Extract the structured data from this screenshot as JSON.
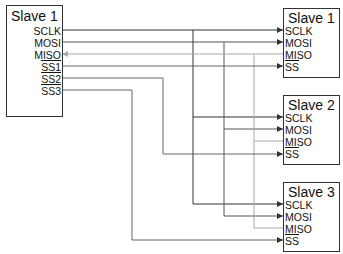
{
  "master": {
    "title": "Slave 1",
    "pins": [
      "SCLK",
      "MOSI",
      "MISO",
      "SS1",
      "SS2",
      "SS3"
    ]
  },
  "slaves": [
    {
      "title": "Slave 1",
      "pins": [
        "SCLK",
        "MOSI",
        "MISO",
        "SS"
      ]
    },
    {
      "title": "Slave 2",
      "pins": [
        "SCLK",
        "MOSI",
        "MISO",
        "SS"
      ]
    },
    {
      "title": "Slave 3",
      "pins": [
        "SCLK",
        "MOSI",
        "MISO",
        "SS"
      ]
    }
  ],
  "colors": {
    "sclk": "#333333",
    "mosi": "#555555",
    "miso": "#999999",
    "ss": "#666666",
    "border": "#333333"
  }
}
